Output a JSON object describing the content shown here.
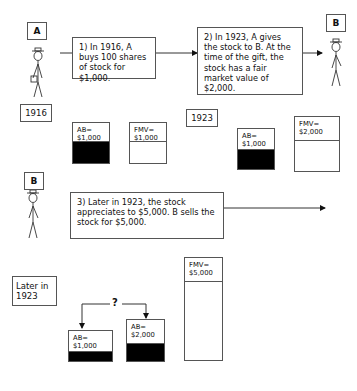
{
  "persons": {
    "a": {
      "label": "A"
    },
    "b1": {
      "label": "B"
    },
    "b2": {
      "label": "B"
    }
  },
  "steps": [
    {
      "text": "1) In 1916, A buys 100 shares of stock for $1,000."
    },
    {
      "text": "2) In 1923, A gives the stock to B.  At the time of the gift, the stock has a fair market value of $2,000."
    },
    {
      "text": "3) Later in 1923, the stock appreciates to $5,000.  B sells the stock for $5,000."
    }
  ],
  "years": {
    "y1916": "1916",
    "y1923": "1923",
    "later1923": "Later in 1923"
  },
  "bars": {
    "ab_1916": {
      "label": "AB=",
      "value": "$1,000"
    },
    "fmv_1916": {
      "label": "FMV=",
      "value": "$1,000"
    },
    "ab_1923": {
      "label": "AB=",
      "value": "$1,000"
    },
    "fmv_1923": {
      "label": "FMV=",
      "value": "$2,000"
    },
    "fmv_later": {
      "label": "FMV=",
      "value": "$5,000"
    },
    "ab_later_a": {
      "label": "AB=",
      "value": "$1,000"
    },
    "ab_later_b": {
      "label": "AB=",
      "value": "$2,000"
    }
  },
  "question_mark": "?"
}
